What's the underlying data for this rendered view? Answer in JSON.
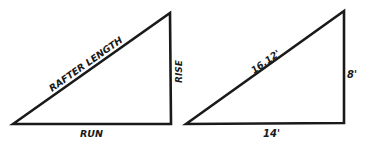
{
  "diagram": {
    "stroke_color": "#1a1a1a",
    "background": "#ffffff",
    "general": {
      "hypotenuse_label": "RAFTER LENGTH",
      "vertical_label": "RISE",
      "base_label": "RUN"
    },
    "example": {
      "hypotenuse_label": "16.12'",
      "vertical_label": "8'",
      "base_label": "14'"
    }
  }
}
